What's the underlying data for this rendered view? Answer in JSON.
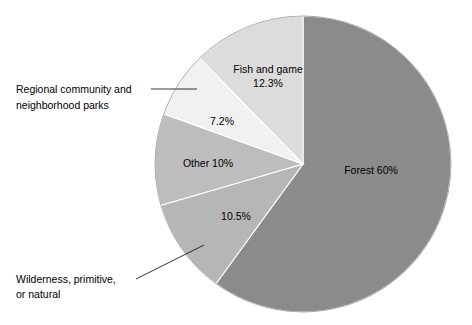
{
  "chart_data": {
    "type": "pie",
    "title": "",
    "subtitle": "",
    "xlabel": "",
    "ylabel": "",
    "legend_position": "none",
    "grid": false,
    "units": "percent",
    "total": 100,
    "start_angle_deg": 0,
    "direction": "clockwise",
    "categories": [
      "Forest",
      "Wilderness, primitive, or natural",
      "Other",
      "Regional community and neighborhood parks",
      "Fish and game"
    ],
    "values": [
      60,
      10.5,
      10,
      7.2,
      12.3
    ],
    "slices": [
      {
        "key": "forest",
        "name": "Forest",
        "value": 60,
        "value_text": "60%",
        "label_text": "Forest 60%",
        "color": "#8b8b8b",
        "label_placement": "inside",
        "label_x": 371,
        "label_y": 171
      },
      {
        "key": "wilderness",
        "name": "Wilderness, primitive, or natural",
        "value": 10.5,
        "value_text": "10.5%",
        "label_text": "10.5%",
        "callout_line1": "Wilderness, primitive,",
        "callout_line2": "or natural",
        "color": "#b6b6b6",
        "label_placement": "inside-with-callout",
        "label_x": 236,
        "label_y": 217,
        "callout_x": 16,
        "callout_y1": 283,
        "callout_y2": 298
      },
      {
        "key": "other",
        "name": "Other",
        "value": 10,
        "value_text": "10%",
        "label_text": "Other 10%",
        "color": "#bdbdbd",
        "label_placement": "inside",
        "label_x": 208,
        "label_y": 164
      },
      {
        "key": "regional-parks",
        "name": "Regional community and neighborhood parks",
        "value": 7.2,
        "value_text": "7.2%",
        "label_text": "7.2%",
        "callout_line1": "Regional community and",
        "callout_line2": "neighborhood parks",
        "color": "#f1f1f1",
        "label_placement": "inside-with-callout",
        "label_x": 222,
        "label_y": 122,
        "callout_x": 16,
        "callout_y1": 93,
        "callout_y2": 109
      },
      {
        "key": "fish-and-game",
        "name": "Fish and game",
        "value": 12.3,
        "value_text": "12.3%",
        "label_line1": "Fish and game",
        "label_line2": "12.3%",
        "label_text": "Fish and game 12.3%",
        "color": "#dcdcdc",
        "label_placement": "inside",
        "label_x": 268,
        "label_y": 70
      }
    ],
    "geometry": {
      "center_x": 303,
      "center_y": 164,
      "radius": 148
    },
    "colors": {
      "background": "#ffffff",
      "text": "#000000",
      "slice_border": "#ffffff",
      "leader_line": "#000000"
    }
  }
}
